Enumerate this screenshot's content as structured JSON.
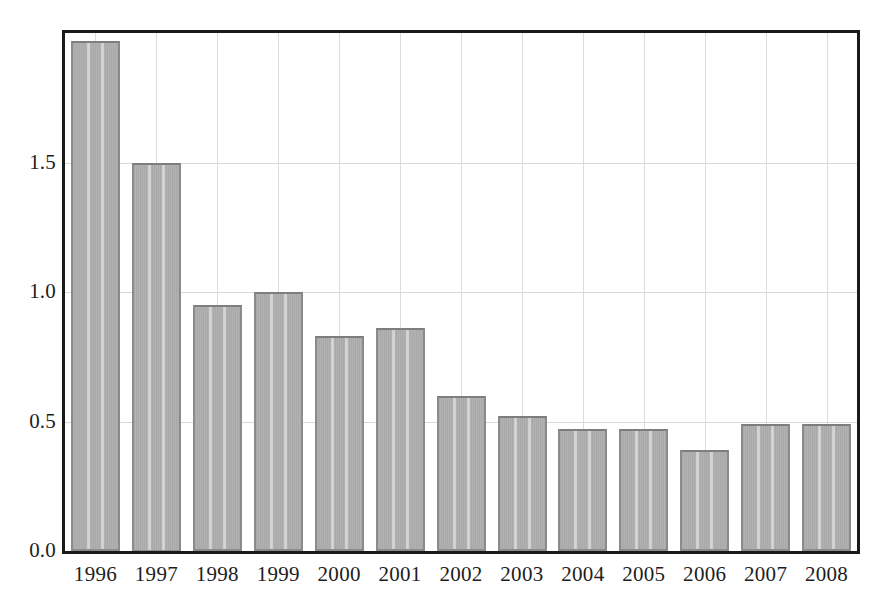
{
  "chart_data": {
    "type": "bar",
    "title": "",
    "subtitle": "",
    "xlabel": "",
    "ylabel": "",
    "categories": [
      "1996",
      "1997",
      "1998",
      "1999",
      "2000",
      "2001",
      "2002",
      "2003",
      "2004",
      "2005",
      "2006",
      "2007",
      "2008"
    ],
    "values": [
      1.97,
      1.5,
      0.95,
      1.0,
      0.83,
      0.86,
      0.6,
      0.52,
      0.47,
      0.47,
      0.39,
      0.49,
      0.49
    ],
    "series": [
      {
        "name": "",
        "values": [
          1.97,
          1.5,
          0.95,
          1.0,
          0.83,
          0.86,
          0.6,
          0.52,
          0.47,
          0.47,
          0.39,
          0.49,
          0.49
        ]
      }
    ],
    "ylim": [
      0.0,
      2.0
    ],
    "xlim_categories": 13,
    "y_tick_labels": [
      "0.0",
      "0.5",
      "1.0",
      "1.5"
    ],
    "y_tick_values": [
      0.0,
      0.5,
      1.0,
      1.5
    ],
    "x_tick_labels": [
      "1996",
      "1997",
      "1998",
      "1999",
      "2000",
      "2001",
      "2002",
      "2003",
      "2004",
      "2005",
      "2006",
      "2007",
      "2008"
    ],
    "grid": "both",
    "grid_horizontal": true,
    "grid_vertical": true,
    "legend": "none",
    "legend_position": "none",
    "annotations": [],
    "colors": {
      "bar_fill": "#a9a9a9",
      "bar_border": "#8b8b8b",
      "frame": "#1a1a1a",
      "gridline": "#d8d8d8",
      "background": "#ffffff",
      "text": "#1d1d1d"
    }
  },
  "axes": {
    "y_labels": [
      {
        "text": "1.5",
        "value": 1.5
      },
      {
        "text": "1.0",
        "value": 1.0
      },
      {
        "text": "0.5",
        "value": 0.5
      },
      {
        "text": "0.0",
        "value": 0.0
      }
    ],
    "x_labels": [
      {
        "text": "1996"
      },
      {
        "text": "1997"
      },
      {
        "text": "1998"
      },
      {
        "text": "1999"
      },
      {
        "text": "2000"
      },
      {
        "text": "2001"
      },
      {
        "text": "2002"
      },
      {
        "text": "2003"
      },
      {
        "text": "2004"
      },
      {
        "text": "2005"
      },
      {
        "text": "2006"
      },
      {
        "text": "2007"
      },
      {
        "text": "2008"
      }
    ]
  }
}
